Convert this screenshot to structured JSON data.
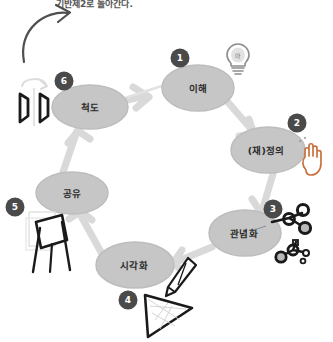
{
  "diagram": {
    "title_partial": "기반제2로 돌아간다.",
    "style": "hand-drawn circular process cycle",
    "colors": {
      "node_fill": "#c9c9c9",
      "node_stroke": "#bdbdbd",
      "ring_arrow": "#d9d9d9",
      "badge_fill": "#4a4a4a",
      "badge_text": "#ffffff",
      "ink": "#2b2b2b",
      "pencil": "#6a6a6a",
      "background": "#ffffff"
    },
    "return_arrow": {
      "name": "return-to-start-arrow",
      "description": "large curved arrow at top-left pointing up and to the right, looping back"
    },
    "steps": [
      {
        "number": "1",
        "label": "이해",
        "icon": "lightbulb-icon",
        "icon_text": "아",
        "cx": 198,
        "cy": 88,
        "rx": 36,
        "ry": 23,
        "badge_x": 180,
        "badge_y": 58
      },
      {
        "number": "2",
        "label": "(재)정의",
        "icon": "pointing-hand-cursor-icon",
        "icon_text": "",
        "cx": 268,
        "cy": 150,
        "rx": 36,
        "ry": 23,
        "badge_x": 297,
        "badge_y": 123
      },
      {
        "number": "3",
        "label": "관념화",
        "icon": "network-nodes-icon",
        "icon_text": "",
        "cx": 245,
        "cy": 233,
        "rx": 36,
        "ry": 23,
        "badge_x": 273,
        "badge_y": 209
      },
      {
        "number": "4",
        "label": "시각화",
        "icon": "triangle-and-pen-icon",
        "icon_text": "",
        "cx": 135,
        "cy": 265,
        "rx": 38,
        "ry": 23,
        "badge_x": 128,
        "badge_y": 300
      },
      {
        "number": "5",
        "label": "공유",
        "icon": "easel-flipchart-icon",
        "icon_text": "",
        "cx": 72,
        "cy": 193,
        "rx": 35,
        "ry": 21,
        "badge_x": 15,
        "badge_y": 207
      },
      {
        "number": "6",
        "label": "척도",
        "icon": "calipers-measure-icon",
        "icon_text": "",
        "cx": 90,
        "cy": 107,
        "rx": 37,
        "ry": 22,
        "badge_x": 64,
        "badge_y": 81
      }
    ]
  }
}
